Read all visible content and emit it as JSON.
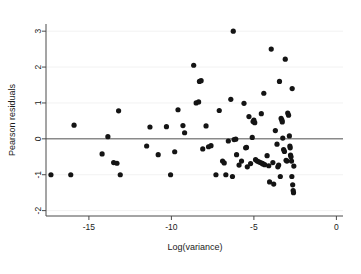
{
  "chart_data": {
    "type": "scatter",
    "title": "",
    "xlabel": "Log(variance)",
    "ylabel": "Pearson residuals",
    "xlim": [
      -17.6,
      0.4
    ],
    "ylim": [
      -2.15,
      3.2
    ],
    "xticks": [
      -15,
      -10,
      -5,
      0
    ],
    "xtick_labels": [
      "-15",
      "-10",
      "-5",
      "0"
    ],
    "yticks": [
      -2,
      -1,
      0,
      1,
      2,
      3
    ],
    "ytick_labels": [
      "-2",
      "-1",
      "0",
      "1",
      "2",
      "3"
    ],
    "grid": false,
    "legend": "none",
    "reference_lines": [
      {
        "orientation": "horizontal",
        "y": 0,
        "color": "#555555"
      }
    ],
    "marker": {
      "shape": "circle",
      "color": "#141414",
      "size": 2.6
    },
    "points": [
      {
        "x": -17.3,
        "y": -1.0
      },
      {
        "x": -16.1,
        "y": -1.0
      },
      {
        "x": -15.9,
        "y": 0.38
      },
      {
        "x": -14.2,
        "y": -0.42
      },
      {
        "x": -13.85,
        "y": 0.06
      },
      {
        "x": -13.5,
        "y": -0.66
      },
      {
        "x": -13.3,
        "y": -0.68
      },
      {
        "x": -13.2,
        "y": 0.78
      },
      {
        "x": -13.1,
        "y": -1.0
      },
      {
        "x": -11.5,
        "y": -0.2
      },
      {
        "x": -11.3,
        "y": 0.33
      },
      {
        "x": -10.8,
        "y": -0.44
      },
      {
        "x": -10.3,
        "y": 0.34
      },
      {
        "x": -10.05,
        "y": -1.0
      },
      {
        "x": -9.8,
        "y": -0.36
      },
      {
        "x": -9.6,
        "y": 0.81
      },
      {
        "x": -9.3,
        "y": 0.37
      },
      {
        "x": -9.2,
        "y": 0.17
      },
      {
        "x": -8.65,
        "y": 2.05
      },
      {
        "x": -8.5,
        "y": 1.0
      },
      {
        "x": -8.35,
        "y": 1.03
      },
      {
        "x": -8.3,
        "y": 1.6
      },
      {
        "x": -8.2,
        "y": 1.62
      },
      {
        "x": -8.1,
        "y": -0.28
      },
      {
        "x": -7.9,
        "y": 0.36
      },
      {
        "x": -7.75,
        "y": -0.22
      },
      {
        "x": -7.6,
        "y": -0.19
      },
      {
        "x": -7.3,
        "y": -1.0
      },
      {
        "x": -7.1,
        "y": 0.79
      },
      {
        "x": -6.9,
        "y": -0.62
      },
      {
        "x": -6.8,
        "y": -0.67
      },
      {
        "x": -6.7,
        "y": -1.0
      },
      {
        "x": -6.55,
        "y": -0.06
      },
      {
        "x": -6.4,
        "y": 1.1
      },
      {
        "x": -6.3,
        "y": -1.05
      },
      {
        "x": -6.25,
        "y": 3.0
      },
      {
        "x": -6.2,
        "y": -0.02
      },
      {
        "x": -6.1,
        "y": -0.01
      },
      {
        "x": -6.05,
        "y": -0.44
      },
      {
        "x": -5.9,
        "y": -0.73
      },
      {
        "x": -5.75,
        "y": -0.62
      },
      {
        "x": -5.6,
        "y": 0.99
      },
      {
        "x": -5.5,
        "y": -0.25
      },
      {
        "x": -5.45,
        "y": -0.24
      },
      {
        "x": -5.4,
        "y": -0.78
      },
      {
        "x": -5.3,
        "y": 0.62
      },
      {
        "x": -5.2,
        "y": -0.69
      },
      {
        "x": -5.1,
        "y": 0.04
      },
      {
        "x": -5.05,
        "y": 0.48
      },
      {
        "x": -5.0,
        "y": 0.52
      },
      {
        "x": -4.95,
        "y": 0.45
      },
      {
        "x": -4.9,
        "y": -0.58
      },
      {
        "x": -4.8,
        "y": -0.62
      },
      {
        "x": -4.7,
        "y": -0.64
      },
      {
        "x": -4.6,
        "y": -0.66
      },
      {
        "x": -4.55,
        "y": 0.7
      },
      {
        "x": -4.5,
        "y": -0.68
      },
      {
        "x": -4.45,
        "y": -0.7
      },
      {
        "x": -4.4,
        "y": 1.27
      },
      {
        "x": -4.35,
        "y": -0.72
      },
      {
        "x": -4.2,
        "y": -0.47
      },
      {
        "x": -4.1,
        "y": -0.75
      },
      {
        "x": -4.05,
        "y": -1.2
      },
      {
        "x": -3.95,
        "y": 2.5
      },
      {
        "x": -3.85,
        "y": -0.66
      },
      {
        "x": -3.8,
        "y": -1.26
      },
      {
        "x": -3.7,
        "y": 0.23
      },
      {
        "x": -3.6,
        "y": -0.15
      },
      {
        "x": -3.55,
        "y": -0.78
      },
      {
        "x": -3.5,
        "y": -0.73
      },
      {
        "x": -3.45,
        "y": 1.6
      },
      {
        "x": -3.4,
        "y": -1.05
      },
      {
        "x": -3.35,
        "y": 0.57
      },
      {
        "x": -3.3,
        "y": 0.52
      },
      {
        "x": -3.28,
        "y": 0.47
      },
      {
        "x": -3.25,
        "y": 0.02
      },
      {
        "x": -3.2,
        "y": -0.3
      },
      {
        "x": -3.15,
        "y": -0.35
      },
      {
        "x": -3.1,
        "y": 2.22
      },
      {
        "x": -3.05,
        "y": -0.6
      },
      {
        "x": -3.0,
        "y": -0.62
      },
      {
        "x": -2.95,
        "y": 0.72
      },
      {
        "x": -2.9,
        "y": 0.66
      },
      {
        "x": -2.85,
        "y": 0.08
      },
      {
        "x": -2.82,
        "y": -0.2
      },
      {
        "x": -2.8,
        "y": -0.25
      },
      {
        "x": -2.78,
        "y": -0.45
      },
      {
        "x": -2.75,
        "y": -0.5
      },
      {
        "x": -2.72,
        "y": -0.62
      },
      {
        "x": -2.7,
        "y": -1.05
      },
      {
        "x": -2.68,
        "y": 1.4
      },
      {
        "x": -2.65,
        "y": -1.28
      },
      {
        "x": -2.62,
        "y": -1.44
      },
      {
        "x": -2.6,
        "y": -1.5
      },
      {
        "x": -2.58,
        "y": -0.76
      }
    ]
  }
}
